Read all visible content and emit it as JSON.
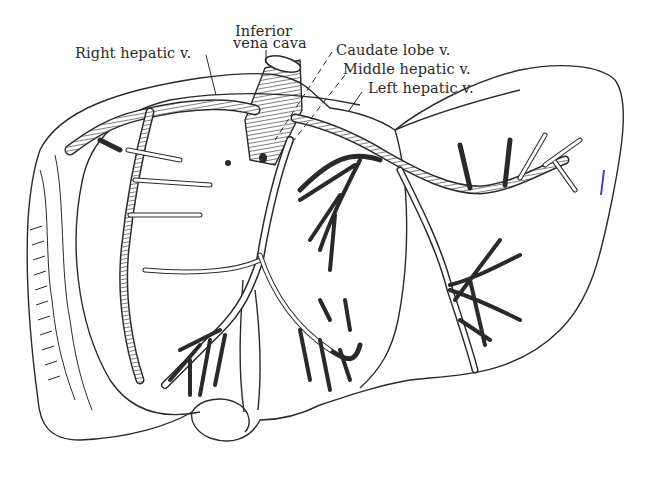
{
  "figure": {
    "colors": {
      "ink": "#2a2a2a",
      "background": "#ffffff"
    }
  },
  "labels": {
    "ivc_line1": "Inferior",
    "ivc_line2": "vena cava",
    "right_hepatic": "Right hepatic v.",
    "caudate_lobe": "Caudate lobe v.",
    "middle_hepatic": "Middle hepatic v.",
    "left_hepatic": "Left hepatic v."
  }
}
